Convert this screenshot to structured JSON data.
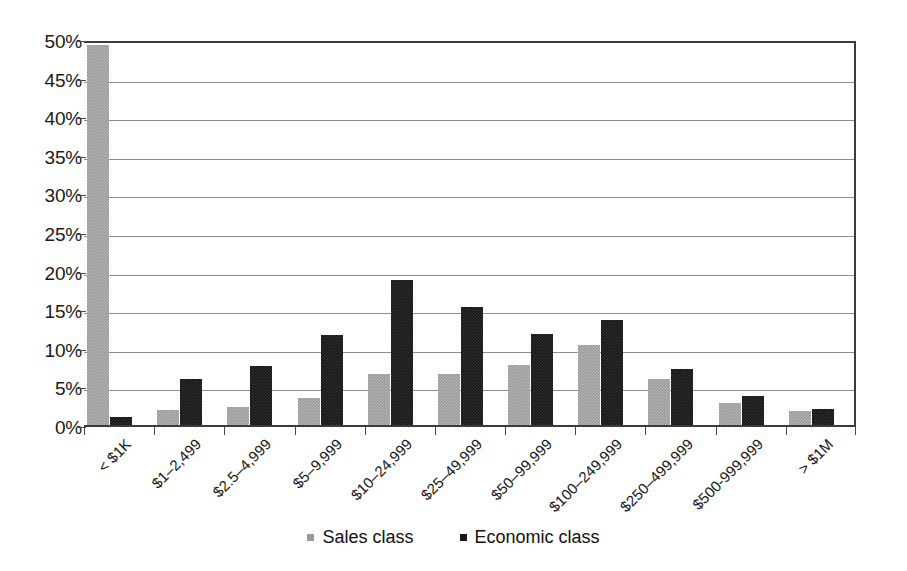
{
  "chart_data": {
    "type": "bar",
    "title": "",
    "subtitle": "",
    "xlabel": "",
    "ylabel": "",
    "ylim": [
      0,
      50
    ],
    "ytick_step": 5,
    "grid": true,
    "grid_axis": "y",
    "legend_position": "bottom-center",
    "value_format": "percent",
    "categories": [
      "< $1K",
      "$1–2,499",
      "$2.5–4,999",
      "$5–9,999",
      "$10–24,999",
      "$25–49,999",
      "$50–99,999",
      "$100–249,999",
      "$250–499,999",
      "$500-999,999",
      "> $1M"
    ],
    "ytick_labels": [
      "0%",
      "5%",
      "10%",
      "15%",
      "20%",
      "25%",
      "30%",
      "35%",
      "40%",
      "45%",
      "50%"
    ],
    "ytick_values": [
      0,
      5,
      10,
      15,
      20,
      25,
      30,
      35,
      40,
      45,
      50
    ],
    "series": [
      {
        "name": "Sales class",
        "color": "#9a9a9a",
        "values": [
          49.2,
          1.9,
          2.3,
          3.5,
          6.6,
          6.6,
          7.8,
          10.3,
          5.9,
          2.8,
          1.8
        ]
      },
      {
        "name": "Economic class",
        "color": "#17171a",
        "values": [
          1.0,
          5.9,
          7.7,
          11.7,
          18.8,
          15.3,
          11.8,
          13.6,
          7.3,
          3.7,
          2.1
        ]
      }
    ]
  },
  "legend": {
    "entries": [
      {
        "label": "Sales class"
      },
      {
        "label": "Economic class"
      }
    ]
  }
}
